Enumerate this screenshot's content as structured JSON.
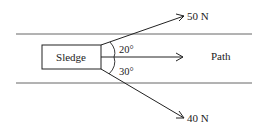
{
  "diagram": {
    "object_label": "Sledge",
    "path_label": "Path",
    "forces": [
      {
        "label": "50 N",
        "angle_label": "20°",
        "direction": "above path"
      },
      {
        "label": "40 N",
        "angle_label": "30°",
        "direction": "below path"
      }
    ],
    "colors": {
      "line": "#333333",
      "background": "#ffffff"
    }
  }
}
